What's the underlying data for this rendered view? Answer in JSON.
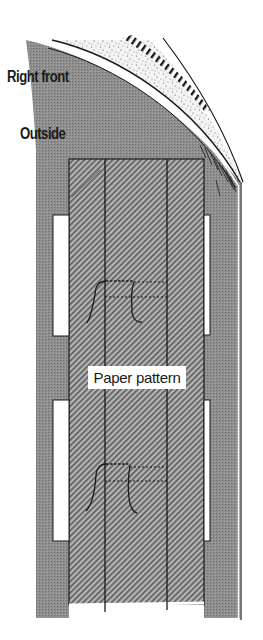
{
  "diagram": {
    "labels": {
      "right_front": "Right front",
      "outside": "Outside",
      "paper_pattern": "Paper pattern"
    },
    "colors": {
      "fabric_gray": "#8c8c8c",
      "pattern_hatch": "#9a9a9a",
      "line": "#1a1a1a",
      "background": "#ffffff"
    },
    "parts": [
      "fabric-front-piece",
      "curved-edge-facing",
      "stippled-interfacing",
      "hatched-seam-allowance",
      "paper-pattern",
      "pattern-fold-lines",
      "buttonhole-strip-left-top",
      "buttonhole-strip-left-bottom",
      "buttonhole-strip-right-top",
      "buttonhole-strip-right-bottom",
      "tailor-tack-stitch-top",
      "tailor-tack-stitch-bottom"
    ]
  }
}
